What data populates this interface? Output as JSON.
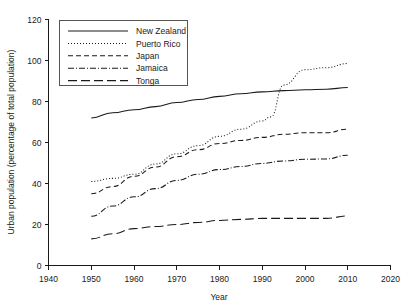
{
  "chart_data": {
    "type": "line",
    "title": "",
    "subtitle": "",
    "xlabel": "Year",
    "ylabel": "Urban population (percentage of total population)",
    "xlim": [
      1940,
      2020
    ],
    "ylim": [
      0,
      120
    ],
    "xticks": [
      1940,
      1950,
      1960,
      1970,
      1980,
      1990,
      2000,
      2010,
      2020
    ],
    "yticks": [
      0,
      20,
      40,
      60,
      80,
      100,
      120
    ],
    "xtick_labels": [
      "1940",
      "1950",
      "1960",
      "1970",
      "1980",
      "1990",
      "2000",
      "2010",
      "2020"
    ],
    "ytick_labels": [
      "0",
      "20",
      "40",
      "60",
      "80",
      "100",
      "120"
    ],
    "grid": false,
    "legend_position": "upper left",
    "x": [
      1950,
      1960,
      1970,
      1980,
      1990,
      2000,
      2010
    ],
    "series": [
      {
        "name": "New Zealand",
        "style": "solid",
        "dash": "none",
        "color": "#1a1a1a",
        "x": [
          1950,
          1955,
          1960,
          1965,
          1970,
          1975,
          1980,
          1985,
          1990,
          1995,
          2000,
          2005,
          2010
        ],
        "values": [
          72,
          74.5,
          76,
          77.5,
          79.5,
          81,
          82.5,
          83.8,
          84.7,
          85.3,
          85.7,
          86,
          86.8
        ]
      },
      {
        "name": "Puerto Rico",
        "style": "dotted",
        "dash": "1,2",
        "color": "#1a1a1a",
        "x": [
          1950,
          1955,
          1960,
          1965,
          1970,
          1975,
          1980,
          1985,
          1990,
          1992,
          1995,
          2000,
          2005,
          2010
        ],
        "values": [
          41,
          42.5,
          44.5,
          49.5,
          54.5,
          58.5,
          63,
          66.5,
          70.5,
          72.5,
          88,
          95.5,
          96.5,
          98.5
        ]
      },
      {
        "name": "Japan",
        "style": "dashed",
        "dash": "5,3",
        "color": "#1a1a1a",
        "x": [
          1950,
          1955,
          1960,
          1965,
          1970,
          1975,
          1980,
          1985,
          1990,
          1995,
          2000,
          2005,
          2010
        ],
        "values": [
          35,
          38.5,
          43.5,
          48,
          53,
          56.5,
          59.5,
          61,
          62.5,
          64,
          64.8,
          64.8,
          66.5
        ]
      },
      {
        "name": "Jamaica",
        "style": "dash-dot",
        "dash": "6,2,1,2",
        "color": "#1a1a1a",
        "x": [
          1950,
          1955,
          1960,
          1965,
          1970,
          1975,
          1980,
          1985,
          1990,
          1995,
          2000,
          2005,
          2010
        ],
        "values": [
          24,
          29,
          33.5,
          37.5,
          41.5,
          44.5,
          46.8,
          48.3,
          49.8,
          51,
          51.8,
          52,
          53.8
        ]
      },
      {
        "name": "Tonga",
        "style": "long-dash",
        "dash": "9,4",
        "color": "#1a1a1a",
        "x": [
          1950,
          1955,
          1960,
          1965,
          1970,
          1975,
          1980,
          1985,
          1990,
          1995,
          2000,
          2005,
          2010
        ],
        "values": [
          13,
          15.5,
          18,
          19,
          20,
          21,
          22,
          22.5,
          23,
          23,
          23,
          23,
          24.2
        ]
      }
    ]
  },
  "legend": {
    "entries": [
      {
        "label": "New Zealand"
      },
      {
        "label": "Puerto Rico"
      },
      {
        "label": "Japan"
      },
      {
        "label": "Jamaica"
      },
      {
        "label": "Tonga"
      }
    ]
  },
  "axes": {
    "x_title": "Year",
    "y_title": "Urban population (percentage of total population)"
  }
}
